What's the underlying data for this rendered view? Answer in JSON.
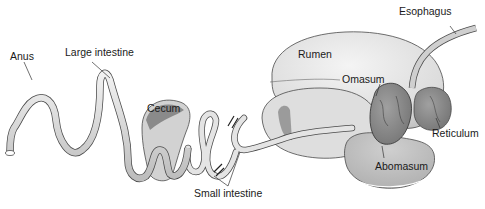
{
  "diagram": {
    "labels": {
      "anus": "Anus",
      "large_intestine": "Large intestine",
      "cecum": "Cecum",
      "small_intestine": "Small intestine",
      "rumen": "Rumen",
      "omasum": "Omasum",
      "esophagus": "Esophagus",
      "reticulum": "Reticulum",
      "abomasum": "Abomasum"
    },
    "colors": {
      "organ_light": "#e6e6e6",
      "organ_mid": "#c9c9c9",
      "organ_dark": "#8f8f8f",
      "outline": "#4a4a4a",
      "leader_line": "#333333"
    }
  }
}
